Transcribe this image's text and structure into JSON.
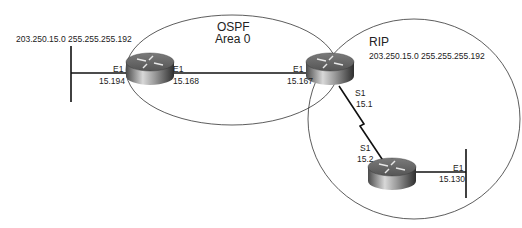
{
  "diagram": {
    "areas": {
      "ospf": {
        "title": "OSPF",
        "subtitle": "Area 0"
      },
      "rip": {
        "title": "RIP",
        "network": "203.250.15.0 255.255.255.192"
      }
    },
    "left_segment": {
      "network": "203.250.15.0 255.255.255.192"
    },
    "routers": [
      {
        "id": "router-left",
        "interfaces": [
          {
            "name": "E1",
            "address": "15.194",
            "side": "left"
          },
          {
            "name": "E1",
            "address": "15.168",
            "side": "right"
          }
        ]
      },
      {
        "id": "router-center",
        "interfaces": [
          {
            "name": "E1",
            "address": "15.167",
            "side": "left"
          },
          {
            "name": "S1",
            "address": "15.1",
            "side": "bottom"
          }
        ]
      },
      {
        "id": "router-bottom",
        "interfaces": [
          {
            "name": "S1",
            "address": "15.2",
            "side": "top"
          },
          {
            "name": "E1",
            "address": "15.130",
            "side": "right"
          }
        ]
      }
    ],
    "colors": {
      "line": "#222222",
      "router_dark": "#3a3a3a",
      "router_light": "#c8c8c8"
    }
  }
}
